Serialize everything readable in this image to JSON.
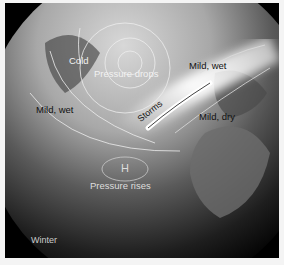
{
  "figure": {
    "season_label": "Winter",
    "labels": {
      "cold": "Cold",
      "pressure_drops": "Pressure drops",
      "mild_wet_left": "Mild, wet",
      "storms": "Storms",
      "mild_wet_right": "Mild, wet",
      "mild_dry": "Mild, dry",
      "high_marker": "H",
      "pressure_rises": "Pressure rises"
    }
  }
}
